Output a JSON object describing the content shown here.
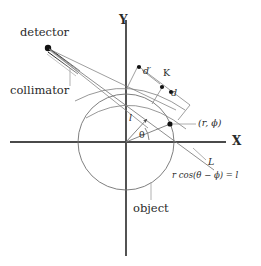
{
  "figure": {
    "background_color": "#ffffff",
    "stroke_color": "#555555",
    "axis_color": "#4a4a4a",
    "text_color": "#2a2a2a",
    "marker_color": "#000000"
  },
  "axes": {
    "x_label": "X",
    "y_label": "Y"
  },
  "labels": {
    "detector": "detector",
    "collimator": "collimator",
    "object": "object",
    "d_prime": "d′",
    "d": "d",
    "k": "K",
    "l": "l",
    "theta": "θ",
    "point": "(r, ϕ)",
    "line_l": "L",
    "equation": "r cos(θ − ϕ) = l"
  },
  "geometry": {
    "origin": {
      "x": 126,
      "y": 142
    },
    "object_circle_radius": 48,
    "detector_point": {
      "x": 47,
      "y": 47
    },
    "source_point": {
      "x": 160,
      "y": 125
    },
    "ray_label_angle_deg": 25,
    "theta_arc_radius": 23,
    "perpendicular_length_l": 31
  }
}
